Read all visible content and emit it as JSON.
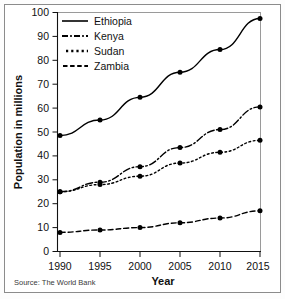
{
  "chart_data": {
    "type": "line",
    "title": "",
    "xlabel": "Year",
    "ylabel": "Population in millions",
    "x": [
      1990,
      1995,
      2000,
      2005,
      2010,
      2015
    ],
    "xticklabels": [
      "1990",
      "1995",
      "2000",
      "2005",
      "2010",
      "2015"
    ],
    "yticklabels": [
      "0",
      "10",
      "20",
      "30",
      "40",
      "50",
      "60",
      "70",
      "80",
      "90",
      "100"
    ],
    "yticks": [
      0,
      10,
      20,
      30,
      40,
      50,
      60,
      70,
      80,
      90,
      100
    ],
    "ylim": [
      0,
      100
    ],
    "xlim": [
      1990,
      2015
    ],
    "grid": false,
    "legend_position": "top-left",
    "series": [
      {
        "name": "Ethiopia",
        "linestyle": "solid",
        "color": "#000000",
        "values": [
          48.5,
          55.0,
          64.5,
          75.0,
          84.5,
          97.5
        ]
      },
      {
        "name": "Kenya",
        "linestyle": "dash-dot",
        "color": "#000000",
        "values": [
          25.0,
          29.0,
          35.5,
          43.5,
          51.0,
          60.5
        ]
      },
      {
        "name": "Sudan",
        "linestyle": "dotted",
        "color": "#000000",
        "values": [
          25.0,
          28.0,
          31.5,
          37.0,
          41.5,
          46.5
        ]
      },
      {
        "name": "Zambia",
        "linestyle": "dashed",
        "color": "#000000",
        "values": [
          8.0,
          9.0,
          10.0,
          12.0,
          14.0,
          17.0
        ]
      }
    ]
  },
  "legend": {
    "entries": [
      {
        "label": "Ethiopia"
      },
      {
        "label": "Kenya"
      },
      {
        "label": "Sudan"
      },
      {
        "label": "Zambia"
      }
    ]
  },
  "axes": {
    "y_title": "Population in millions",
    "x_title": "Year",
    "y_ticks": [
      "100",
      "90",
      "80",
      "70",
      "60",
      "50",
      "40",
      "30",
      "20",
      "10",
      "0"
    ],
    "x_ticks": [
      "1990",
      "1995",
      "2000",
      "2005",
      "2010",
      "2015"
    ]
  },
  "source": {
    "text": "Source: The World Bank"
  }
}
